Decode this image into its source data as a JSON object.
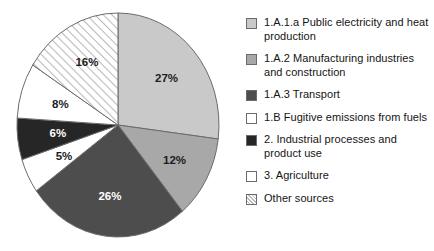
{
  "chart_data": {
    "type": "pie",
    "title": "",
    "subtitle": "",
    "xlabel": "",
    "ylabel": "",
    "legend_position": "right",
    "grid": false,
    "units": "percent",
    "start_angle_deg": 0,
    "direction": "clockwise",
    "categories": [
      "1.A.1.a Public electricity and heat production",
      "1.A.2 Manufacturing industries and construction",
      "1.A.3 Transport",
      "1.B Fugitive emissions from fuels",
      "2. Industrial processes and product use",
      "3. Agriculture",
      "Other sources"
    ],
    "values": [
      27,
      12,
      26,
      5,
      6,
      8,
      16
    ],
    "data_labels": [
      "27%",
      "12%",
      "26%",
      "5%",
      "6%",
      "8%",
      "16%"
    ],
    "slices": [
      {
        "label": "1.A.1.a Public electricity and heat production",
        "value": 27,
        "data_label": "27%",
        "fill": "#c9c9c9",
        "pattern": "solid",
        "label_color": "dark"
      },
      {
        "label": "1.A.2 Manufacturing industries and construction",
        "value": 12,
        "data_label": "12%",
        "fill": "#a8a8a8",
        "pattern": "solid",
        "label_color": "dark"
      },
      {
        "label": "1.A.3 Transport",
        "value": 26,
        "data_label": "26%",
        "fill": "#4d4d4d",
        "pattern": "solid",
        "label_color": "light"
      },
      {
        "label": "1.B Fugitive emissions from fuels",
        "value": 5,
        "data_label": "5%",
        "fill": "#ffffff",
        "pattern": "solid",
        "label_color": "dark"
      },
      {
        "label": "2. Industrial processes and product use",
        "value": 6,
        "data_label": "6%",
        "fill": "#262626",
        "pattern": "solid",
        "label_color": "light"
      },
      {
        "label": "3. Agriculture",
        "value": 8,
        "data_label": "8%",
        "fill": "#ffffff",
        "pattern": "solid",
        "label_color": "dark"
      },
      {
        "label": "Other sources",
        "value": 16,
        "data_label": "16%",
        "fill": "#ffffff",
        "pattern": "diagonal-hatch",
        "label_color": "dark"
      }
    ],
    "colors": {
      "outline": "#6b6b6b",
      "hatch_line": "#b4b4b4",
      "background": "#ffffff"
    }
  },
  "legend": {
    "items": [
      {
        "label": "1.A.1.a Public electricity and heat production",
        "swatch": "#c9c9c9",
        "pattern": "solid"
      },
      {
        "label": "1.A.2 Manufacturing industries and construction",
        "swatch": "#a8a8a8",
        "pattern": "solid"
      },
      {
        "label": "1.A.3 Transport",
        "swatch": "#4d4d4d",
        "pattern": "solid"
      },
      {
        "label": "1.B Fugitive emissions from fuels",
        "swatch": "#ffffff",
        "pattern": "solid"
      },
      {
        "label": "2. Industrial processes and product use",
        "swatch": "#262626",
        "pattern": "solid"
      },
      {
        "label": "3. Agriculture",
        "swatch": "#ffffff",
        "pattern": "solid"
      },
      {
        "label": "Other sources",
        "swatch": "#ffffff",
        "pattern": "diagonal-hatch"
      }
    ]
  }
}
